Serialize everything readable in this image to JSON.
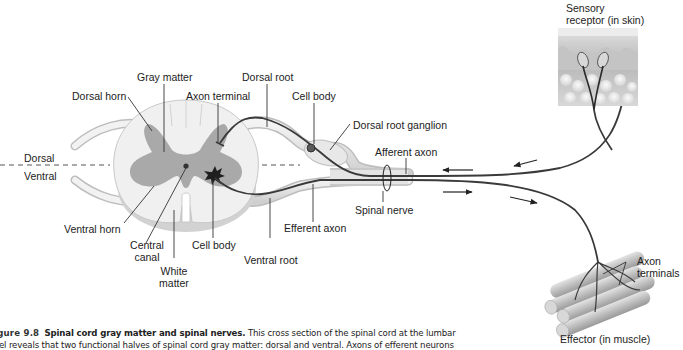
{
  "figure": {
    "number_label": "igure 9.8",
    "title": "Spinal cord gray matter and spinal nerves.",
    "caption_line1_body": "This cross section of the spinal cord at the lumbar",
    "caption_line2_partial": "vel reveals that two functional halves of spinal cord gray matter: dorsal and ventral. Axons of efferent neurons"
  },
  "orientation": {
    "dorsal": "Dorsal",
    "ventral": "Ventral"
  },
  "labels": {
    "gray_matter": "Gray matter",
    "dorsal_root": "Dorsal root",
    "dorsal_horn": "Dorsal horn",
    "axon_terminal": "Axon terminal",
    "cell_body_top": "Cell body",
    "dorsal_root_ganglion": "Dorsal root ganglion",
    "afferent_axon": "Afferent axon",
    "spinal_nerve": "Spinal nerve",
    "efferent_axon": "Efferent axon",
    "ventral_horn": "Ventral horn",
    "central_canal_1": "Central",
    "central_canal_2": "canal",
    "cell_body_bottom": "Cell body",
    "white_matter_1": "White",
    "white_matter_2": "matter",
    "ventral_root": "Ventral root",
    "sensory_receptor_1": "Sensory",
    "sensory_receptor_2": "receptor (in skin)",
    "axon_terminals_1": "Axon",
    "axon_terminals_2": "terminals",
    "effector": "Effector (in muscle)"
  },
  "colors": {
    "gray_matter": "#a9a9a9",
    "white_matter": "#ececec",
    "nerve_fill": "#e6e6e6",
    "axon_stroke": "#3a3a3a",
    "leader_line": "#333333",
    "skin_top": "#d8d8d8",
    "skin_mid": "#bdbdbd",
    "fat": "#e9e9e9",
    "muscle": "#c8c8c8"
  }
}
